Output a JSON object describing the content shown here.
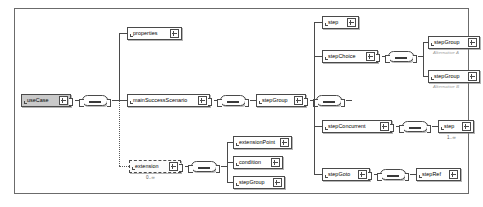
{
  "diagram": {
    "frame_color": "#6b6b6b",
    "root_fill": "#c9c9c9",
    "line_color": "#4a4a4a"
  },
  "nodes": {
    "use_case": {
      "label": "useCase",
      "kind": "root"
    },
    "properties": {
      "label": "properties",
      "kind": "element"
    },
    "main_success": {
      "label": "mainSuccessScenario",
      "kind": "element"
    },
    "extension": {
      "label": "extension",
      "kind": "optional",
      "occurs": "0..∞"
    },
    "extension_point": {
      "label": "extensionPoint",
      "kind": "element"
    },
    "condition": {
      "label": "condition",
      "kind": "element"
    },
    "ext_step_group": {
      "label": "stepGroup",
      "kind": "element"
    },
    "step_group_main": {
      "label": "stepGroup",
      "kind": "element"
    },
    "step": {
      "label": "step",
      "kind": "element"
    },
    "step_choice": {
      "label": "stepChoice",
      "kind": "element"
    },
    "choice_group_a": {
      "label": "stepGroup",
      "kind": "element",
      "annotation": "Alternative A"
    },
    "choice_group_b": {
      "label": "stepGroup",
      "kind": "element",
      "annotation": "Alternative B"
    },
    "step_concurrent": {
      "label": "stepConcurrent",
      "kind": "element"
    },
    "concurrent_step": {
      "label": "step",
      "kind": "element",
      "occurs": "1..∞"
    },
    "step_goto": {
      "label": "stepGoto",
      "kind": "element"
    },
    "step_ref": {
      "label": "stepRef",
      "kind": "element"
    }
  },
  "compositors": {
    "use_case_seq": {
      "type": "sequence"
    },
    "main_seq": {
      "type": "sequence"
    },
    "step_group_seq": {
      "type": "sequence"
    },
    "extension_seq": {
      "type": "sequence"
    },
    "choice_seq": {
      "type": "choice"
    },
    "concurrent_seq": {
      "type": "sequence"
    },
    "goto_seq": {
      "type": "sequence"
    }
  },
  "icons": {
    "expand": "expand-plus-icon",
    "compositor": "sequence-compositor-icon"
  }
}
